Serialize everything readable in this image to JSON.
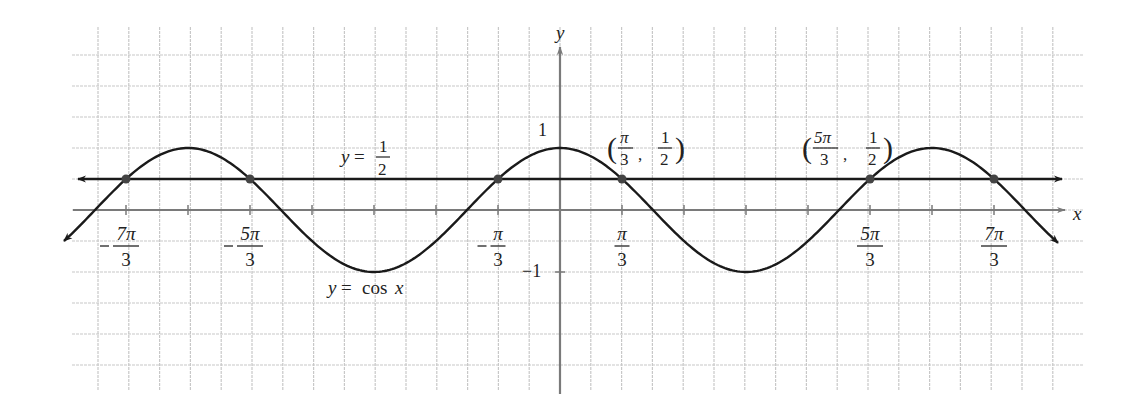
{
  "chart_data": {
    "type": "line",
    "title": "",
    "xlabel": "x",
    "ylabel": "y",
    "grid": true,
    "xlim": [
      -8.4,
      8.4
    ],
    "ylim": [
      -1.4,
      1.4
    ],
    "series": [
      {
        "name": "y = cos x",
        "function": "cos(x)",
        "color": "#1a1a1a",
        "arrows_both_ends": true
      },
      {
        "name": "y = 1/2",
        "function": "0.5",
        "color": "#1a1a1a",
        "arrows_both_ends": true
      }
    ],
    "x_ticks_every": "π/3",
    "y_ticks": [
      {
        "value": 1,
        "label": "1"
      },
      {
        "value": -1,
        "label": "−1"
      }
    ],
    "x_tick_labels": [
      {
        "value": -7.3304,
        "neg": true,
        "num": "7π",
        "den": "3"
      },
      {
        "value": -5.236,
        "neg": true,
        "num": "5π",
        "den": "3"
      },
      {
        "value": -1.0472,
        "neg": true,
        "num": "π",
        "den": "3"
      },
      {
        "value": 1.0472,
        "neg": false,
        "num": "π",
        "den": "3"
      },
      {
        "value": 5.236,
        "neg": false,
        "num": "5π",
        "den": "3"
      },
      {
        "value": 7.3304,
        "neg": false,
        "num": "7π",
        "den": "3"
      }
    ],
    "intersection_points": [
      {
        "x": -7.3304,
        "y": 0.5
      },
      {
        "x": -5.236,
        "y": 0.5
      },
      {
        "x": -1.0472,
        "y": 0.5
      },
      {
        "x": 1.0472,
        "y": 0.5
      },
      {
        "x": 5.236,
        "y": 0.5
      },
      {
        "x": 7.3304,
        "y": 0.5
      }
    ],
    "annotations": [
      {
        "text": "y = 1/2",
        "near": "horizontal line, left of y-axis"
      },
      {
        "text": "y = cos x",
        "near": "curve minimum at x = -π"
      },
      {
        "text": "(π/3, 1/2)",
        "x": 1.0472,
        "y": 0.5
      },
      {
        "text": "(5π/3, 1/2)",
        "x": 5.236,
        "y": 0.5
      }
    ]
  },
  "labels": {
    "x_axis": "x",
    "y_axis": "y",
    "y_one": "1",
    "y_neg_one": "−1",
    "line_label_lhs": "y",
    "line_label_eq": "=",
    "line_label_num": "1",
    "line_label_den": "2",
    "curve_label_lhs": "y",
    "curve_label_eq": "=",
    "curve_label_fn": "cos",
    "curve_label_var": "x",
    "point1": {
      "x_num": "π",
      "x_den": "3",
      "y_num": "1",
      "y_den": "2"
    },
    "point2": {
      "x_num": "5π",
      "x_den": "3",
      "y_num": "1",
      "y_den": "2"
    }
  },
  "colors": {
    "grid": "#c8c8c8",
    "axis": "#7a7a7a",
    "curve": "#1a1a1a",
    "point": "#444444"
  }
}
